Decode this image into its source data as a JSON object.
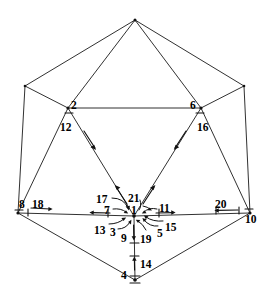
{
  "figure": {
    "ink_color": "#111111",
    "background_color": "#ffffff",
    "width": 270,
    "height": 297
  },
  "vertices": [
    {
      "id": "apex",
      "name": "top-apex-vertex",
      "x": 135,
      "y": 20
    },
    {
      "id": "upper-left",
      "name": "upper-left-vertex",
      "x": 25,
      "y": 86
    },
    {
      "id": "upper-right",
      "name": "upper-right-vertex",
      "x": 244,
      "y": 86
    },
    {
      "id": "node2",
      "name": "vertex-2",
      "x": 68,
      "y": 108
    },
    {
      "id": "node6",
      "name": "vertex-6",
      "x": 201,
      "y": 108
    },
    {
      "id": "lower-left",
      "name": "lower-left-vertex",
      "x": 18,
      "y": 213
    },
    {
      "id": "lower-right",
      "name": "lower-right-vertex",
      "x": 250,
      "y": 213
    },
    {
      "id": "center",
      "name": "center-vertex-1",
      "x": 134,
      "y": 216
    },
    {
      "id": "bottom",
      "name": "bottom-apex-vertex-4",
      "x": 135,
      "y": 280
    }
  ],
  "labels": [
    {
      "text": "2",
      "name": "label-2",
      "x": 71,
      "y": 100
    },
    {
      "text": "12",
      "name": "label-12",
      "x": 60,
      "y": 122
    },
    {
      "text": "6",
      "name": "label-6",
      "x": 190,
      "y": 100
    },
    {
      "text": "16",
      "name": "label-16",
      "x": 197,
      "y": 122
    },
    {
      "text": "8",
      "name": "label-8",
      "x": 19,
      "y": 199
    },
    {
      "text": "18",
      "name": "label-18",
      "x": 32,
      "y": 199
    },
    {
      "text": "20",
      "name": "label-20",
      "x": 215,
      "y": 199
    },
    {
      "text": "10",
      "name": "label-10",
      "x": 245,
      "y": 214
    },
    {
      "text": "17",
      "name": "label-17",
      "x": 96,
      "y": 196
    },
    {
      "text": "21",
      "name": "label-21",
      "x": 128,
      "y": 195
    },
    {
      "text": "7",
      "name": "label-7",
      "x": 104,
      "y": 207
    },
    {
      "text": "1",
      "name": "label-1",
      "x": 131,
      "y": 207
    },
    {
      "text": "11",
      "name": "label-11",
      "x": 159,
      "y": 205
    },
    {
      "text": "13",
      "name": "label-13",
      "x": 94,
      "y": 227
    },
    {
      "text": "3",
      "name": "label-3",
      "x": 110,
      "y": 229
    },
    {
      "text": "9",
      "name": "label-9",
      "x": 121,
      "y": 235
    },
    {
      "text": "19",
      "name": "label-19",
      "x": 140,
      "y": 236
    },
    {
      "text": "5",
      "name": "label-5",
      "x": 157,
      "y": 230
    },
    {
      "text": "15",
      "name": "label-15",
      "x": 165,
      "y": 224
    },
    {
      "text": "14",
      "name": "label-14",
      "x": 140,
      "y": 261
    },
    {
      "text": "4",
      "name": "label-4",
      "x": 121,
      "y": 272
    }
  ],
  "edge_numbers": [
    1,
    2,
    3,
    4,
    5,
    6,
    7,
    8,
    9,
    10,
    11,
    12,
    13,
    14,
    15,
    16,
    17,
    18,
    19,
    20,
    21
  ]
}
